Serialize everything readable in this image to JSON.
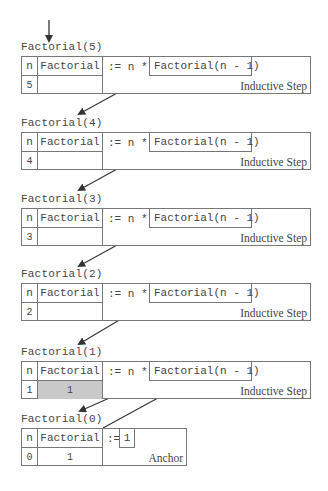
{
  "diagram": {
    "frames": [
      {
        "label": "Factorial(5)",
        "n_header": "n",
        "f_header": "Factorial",
        "n_value": "5",
        "f_value": "",
        "operator": ":= n *",
        "call": "Factorial(n - 1)",
        "kind": "Inductive Step",
        "shaded": false
      },
      {
        "label": "Factorial(4)",
        "n_header": "n",
        "f_header": "Factorial",
        "n_value": "4",
        "f_value": "",
        "operator": ":= n *",
        "call": "Factorial(n - 1)",
        "kind": "Inductive Step",
        "shaded": false
      },
      {
        "label": "Factorial(3)",
        "n_header": "n",
        "f_header": "Factorial",
        "n_value": "3",
        "f_value": "",
        "operator": ":= n *",
        "call": "Factorial(n - 1)",
        "kind": "Inductive Step",
        "shaded": false
      },
      {
        "label": "Factorial(2)",
        "n_header": "n",
        "f_header": "Factorial",
        "n_value": "2",
        "f_value": "",
        "operator": ":= n *",
        "call": "Factorial(n - 1)",
        "kind": "Inductive Step",
        "shaded": false
      },
      {
        "label": "Factorial(1)",
        "n_header": "n",
        "f_header": "Factorial",
        "n_value": "1",
        "f_value": "1",
        "operator": ":= n *",
        "call": "Factorial(n - 1)",
        "kind": "Inductive Step",
        "shaded": true
      }
    ],
    "anchor": {
      "label": "Factorial(0)",
      "n_header": "n",
      "f_header": "Factorial",
      "n_value": "0",
      "f_value": "1",
      "operator": ":=",
      "value": "1",
      "kind": "Anchor"
    },
    "colors": {
      "line": "#777777",
      "text": "#444444",
      "shade": "#c9c9c9",
      "arrow": "#333333"
    }
  }
}
